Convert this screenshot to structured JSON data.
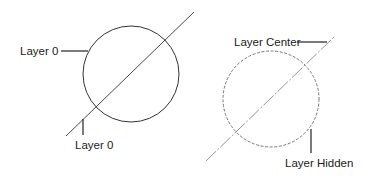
{
  "diagram": {
    "colors": {
      "background": "#ffffff",
      "solid_stroke": "#333333",
      "dashed_stroke": "#777777",
      "leader": "#222222",
      "text": "#222222"
    },
    "left_figure": {
      "circle": {
        "cx": 131,
        "cy": 74,
        "r": 48,
        "linetype": "continuous"
      },
      "line": {
        "x1": 66,
        "y1": 136,
        "x2": 194,
        "y2": 12,
        "linetype": "continuous"
      },
      "labels": [
        {
          "text": "Layer 0",
          "x": 20,
          "y": 55,
          "target": "circle"
        },
        {
          "text": "Layer 0",
          "x": 75,
          "y": 149,
          "target": "line"
        }
      ]
    },
    "right_figure": {
      "circle": {
        "cx": 271,
        "cy": 99,
        "r": 48,
        "linetype": "hidden"
      },
      "line": {
        "x1": 206,
        "y1": 161,
        "x2": 334,
        "y2": 37,
        "linetype": "center"
      },
      "labels": [
        {
          "text": "Layer Center",
          "x": 234,
          "y": 46,
          "target": "line"
        },
        {
          "text": "Layer Hidden",
          "x": 285,
          "y": 167,
          "target": "circle"
        }
      ]
    }
  }
}
